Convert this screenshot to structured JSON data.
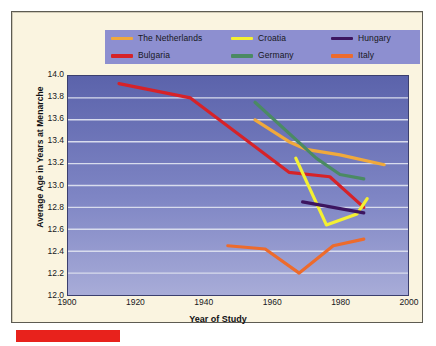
{
  "figure": {
    "background_color": "#faf4e0",
    "plot_background_top": "#5b63ab",
    "plot_background_bottom": "#a8acd8",
    "legend_background": "#8d8fd0",
    "accent_bar_color": "#e8221c"
  },
  "legend": {
    "items": [
      {
        "label": "The Netherlands",
        "color": "#f0a93c",
        "swatch_name": "legend-swatch-netherlands"
      },
      {
        "label": "Croatia",
        "color": "#f4f032",
        "swatch_name": "legend-swatch-croatia"
      },
      {
        "label": "Hungary",
        "color": "#3c1560",
        "swatch_name": "legend-swatch-hungary"
      },
      {
        "label": "Bulgaria",
        "color": "#d62228",
        "swatch_name": "legend-swatch-bulgaria"
      },
      {
        "label": "Germany",
        "color": "#4a8a63",
        "swatch_name": "legend-swatch-germany"
      },
      {
        "label": "Italy",
        "color": "#ed6b2c",
        "swatch_name": "legend-swatch-italy"
      }
    ]
  },
  "chart_data": {
    "type": "line",
    "title": "",
    "xlabel": "Year of Study",
    "ylabel": "Average Age in Years at Menarche",
    "xlim": [
      1900,
      2000
    ],
    "ylim": [
      12.0,
      14.0
    ],
    "xticks": [
      1900,
      1920,
      1940,
      1960,
      1980,
      2000
    ],
    "yticks": [
      12.0,
      12.2,
      12.4,
      12.6,
      12.8,
      13.0,
      13.2,
      13.4,
      13.6,
      13.8,
      14.0
    ],
    "grid": "horizontal",
    "gridline_color": "#d8dced",
    "legend_position": "above-plot",
    "series": [
      {
        "name": "The Netherlands",
        "color": "#f0a93c",
        "points": [
          {
            "x": 1955,
            "y": 13.6
          },
          {
            "x": 1965,
            "y": 13.4
          },
          {
            "x": 1970,
            "y": 13.33
          },
          {
            "x": 1980,
            "y": 13.28
          },
          {
            "x": 1993,
            "y": 13.19
          }
        ]
      },
      {
        "name": "Bulgaria",
        "color": "#d62228",
        "points": [
          {
            "x": 1915,
            "y": 13.93
          },
          {
            "x": 1936,
            "y": 13.8
          },
          {
            "x": 1965,
            "y": 13.12
          },
          {
            "x": 1977,
            "y": 13.08
          },
          {
            "x": 1987,
            "y": 12.8
          }
        ]
      },
      {
        "name": "Croatia",
        "color": "#f4f032",
        "points": [
          {
            "x": 1967,
            "y": 13.25
          },
          {
            "x": 1976,
            "y": 12.64
          },
          {
            "x": 1985,
            "y": 12.74
          },
          {
            "x": 1988,
            "y": 12.88
          }
        ]
      },
      {
        "name": "Germany",
        "color": "#4a8a63",
        "points": [
          {
            "x": 1955,
            "y": 13.76
          },
          {
            "x": 1973,
            "y": 13.25
          },
          {
            "x": 1980,
            "y": 13.1
          },
          {
            "x": 1987,
            "y": 13.06
          }
        ]
      },
      {
        "name": "Hungary",
        "color": "#3c1560",
        "points": [
          {
            "x": 1969,
            "y": 12.85
          },
          {
            "x": 1987,
            "y": 12.75
          }
        ]
      },
      {
        "name": "Italy",
        "color": "#ed6b2c",
        "points": [
          {
            "x": 1947,
            "y": 12.45
          },
          {
            "x": 1958,
            "y": 12.42
          },
          {
            "x": 1968,
            "y": 12.2
          },
          {
            "x": 1978,
            "y": 12.45
          },
          {
            "x": 1987,
            "y": 12.51
          }
        ]
      }
    ]
  }
}
